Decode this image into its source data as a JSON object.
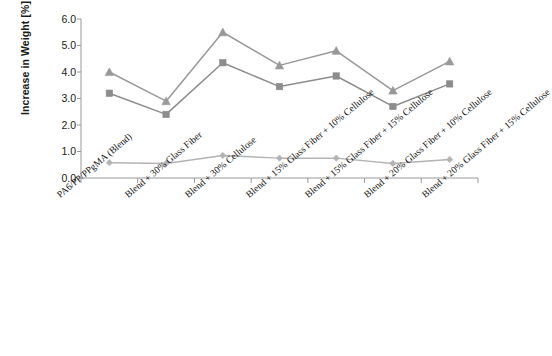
{
  "chart_data": {
    "type": "line",
    "title": "",
    "xlabel": "",
    "ylabel": "Increase in Weight [%]",
    "ylim": [
      0.0,
      6.0
    ],
    "ytick_labels": [
      "6.0",
      "5.0",
      "4.0",
      "3.0",
      "2.0",
      "1.0",
      "0.0"
    ],
    "ytick_values": [
      6.0,
      5.0,
      4.0,
      3.0,
      2.0,
      1.0,
      0.0
    ],
    "grid": false,
    "legend": "none",
    "categories": [
      "PA6/PP/PPgMA (Blend)",
      "Blend + 30% Glass Fiber",
      "Blend + 30% Cellulose",
      "Blend + 15% Glass Fiber + 10% Cellulose",
      "Blend + 15% Glass Fiber + 15% Cellulose",
      "Blend + 20% Glass Fiber + 10% Cellulose",
      "Blend + 20% Glass Fiber + 15% Cellulose"
    ],
    "series": [
      {
        "name": "series-triangle",
        "marker": "triangle",
        "color": "#999999",
        "values": [
          4.0,
          2.9,
          5.5,
          4.25,
          4.8,
          3.3,
          4.4
        ]
      },
      {
        "name": "series-square",
        "marker": "square",
        "color": "#8c8c8c",
        "values": [
          3.2,
          2.4,
          4.35,
          3.45,
          3.85,
          2.7,
          3.55
        ]
      },
      {
        "name": "series-diamond",
        "marker": "diamond",
        "color": "#b3b3b3",
        "values": [
          0.58,
          0.55,
          0.85,
          0.75,
          0.75,
          0.55,
          0.7
        ]
      }
    ],
    "colors": {
      "axis": "#999999",
      "text": "#1a1a1a",
      "background": "#ffffff"
    }
  }
}
